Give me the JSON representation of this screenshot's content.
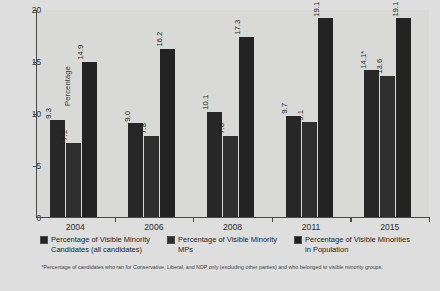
{
  "chart_data": {
    "type": "bar",
    "title": "",
    "xlabel": "",
    "ylabel": "Percentage",
    "categories": [
      "2004",
      "2006",
      "2008",
      "2011",
      "2015"
    ],
    "ylim": [
      0,
      20
    ],
    "yticks": [
      "0",
      "5",
      "10",
      "15",
      "20"
    ],
    "grid": false,
    "legend_position": "bottom",
    "series": [
      {
        "name": "Percentage of Visible Minority Candidates (all candidates)",
        "values": [
          9.3,
          9.0,
          10.1,
          9.7,
          14.1
        ],
        "labels": [
          "9.3",
          "9.0",
          "10.1",
          "9.7",
          "14.1*"
        ],
        "color": "#272727"
      },
      {
        "name": "Percentage of Visible Minority MPs",
        "values": [
          7.1,
          7.8,
          7.8,
          9.1,
          13.6
        ],
        "labels": [
          "7.1",
          "7.8",
          "7.8",
          "9.1",
          "13.6"
        ],
        "color": "#2f2f2f"
      },
      {
        "name": "Percentage of Visible Minorities in Population",
        "values": [
          14.9,
          16.2,
          17.3,
          19.1,
          19.1
        ],
        "labels": [
          "14.9",
          "16.2",
          "17.3",
          "19.1",
          "19.1"
        ],
        "color": "#232323"
      }
    ],
    "footnote": "*Percentage of candidates who ran for Conservative, Liberal, and NDP only (excluding other parties) and who belonged to visible minority groups."
  },
  "legend": {
    "items": [
      {
        "label": "Percentage of Visible Minority Candidates (all candidates)"
      },
      {
        "label": "Percentage of Visible Minority MPs"
      },
      {
        "label": "Percentage of Visible Minorities in Population"
      }
    ]
  }
}
